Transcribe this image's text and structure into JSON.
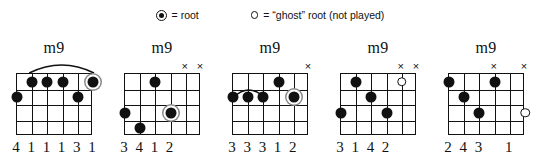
{
  "legend": {
    "root_symbol_name": "filled-circle-with-ring",
    "root_text": "= root",
    "ghost_symbol_name": "hollow-circle",
    "ghost_text": "= “ghost” root (not played)"
  },
  "colors": {
    "ink": "#111111",
    "paper": "#ffffff",
    "root_ring": "#8a8a8a"
  },
  "grid": {
    "strings": 6,
    "frets": 4
  },
  "chords": [
    {
      "name": "m9",
      "barre": {
        "from_string": 5,
        "to_string": 1,
        "above_nut": true
      },
      "mutes": [],
      "dots": [
        {
          "string": 5,
          "fret": 1,
          "type": "normal"
        },
        {
          "string": 4,
          "fret": 1,
          "type": "normal"
        },
        {
          "string": 3,
          "fret": 1,
          "type": "normal"
        },
        {
          "string": 1,
          "fret": 1,
          "type": "root"
        },
        {
          "string": 6,
          "fret": 2,
          "type": "normal"
        },
        {
          "string": 2,
          "fret": 2,
          "type": "normal"
        }
      ],
      "fingering": [
        {
          "string": 6,
          "label": "4"
        },
        {
          "string": 5,
          "label": "1"
        },
        {
          "string": 4,
          "label": "1"
        },
        {
          "string": 3,
          "label": "1"
        },
        {
          "string": 2,
          "label": "3"
        },
        {
          "string": 1,
          "label": "1"
        }
      ]
    },
    {
      "name": "m9",
      "barre": null,
      "mutes": [
        2,
        1
      ],
      "dots": [
        {
          "string": 4,
          "fret": 1,
          "type": "normal"
        },
        {
          "string": 6,
          "fret": 3,
          "type": "normal"
        },
        {
          "string": 3,
          "fret": 3,
          "type": "root"
        },
        {
          "string": 5,
          "fret": 4,
          "type": "normal"
        }
      ],
      "fingering": [
        {
          "string": 6,
          "label": "3"
        },
        {
          "string": 5,
          "label": "4"
        },
        {
          "string": 4,
          "label": "1"
        },
        {
          "string": 3,
          "label": "2"
        }
      ]
    },
    {
      "name": "m9",
      "barre": {
        "from_string": 6,
        "to_string": 4,
        "above_nut": false,
        "fret": 2
      },
      "mutes": [
        1
      ],
      "dots": [
        {
          "string": 3,
          "fret": 1,
          "type": "normal"
        },
        {
          "string": 6,
          "fret": 2,
          "type": "normal"
        },
        {
          "string": 5,
          "fret": 2,
          "type": "normal"
        },
        {
          "string": 4,
          "fret": 2,
          "type": "normal"
        },
        {
          "string": 2,
          "fret": 2,
          "type": "root"
        }
      ],
      "fingering": [
        {
          "string": 6,
          "label": "3"
        },
        {
          "string": 5,
          "label": "3"
        },
        {
          "string": 4,
          "label": "3"
        },
        {
          "string": 3,
          "label": "1"
        },
        {
          "string": 2,
          "label": "2"
        }
      ]
    },
    {
      "name": "m9",
      "barre": null,
      "mutes": [
        2,
        1
      ],
      "dots": [
        {
          "string": 2,
          "fret": 1,
          "type": "ghost"
        },
        {
          "string": 5,
          "fret": 1,
          "type": "normal"
        },
        {
          "string": 4,
          "fret": 2,
          "type": "normal"
        },
        {
          "string": 6,
          "fret": 3,
          "type": "normal"
        },
        {
          "string": 3,
          "fret": 3,
          "type": "normal"
        }
      ],
      "fingering": [
        {
          "string": 6,
          "label": "3"
        },
        {
          "string": 5,
          "label": "1"
        },
        {
          "string": 4,
          "label": "4"
        },
        {
          "string": 3,
          "label": "2"
        }
      ]
    },
    {
      "name": "m9",
      "barre": null,
      "mutes": [
        3,
        1
      ],
      "dots": [
        {
          "string": 6,
          "fret": 1,
          "type": "normal"
        },
        {
          "string": 3,
          "fret": 1,
          "type": "normal"
        },
        {
          "string": 5,
          "fret": 2,
          "type": "normal"
        },
        {
          "string": 4,
          "fret": 3,
          "type": "normal"
        },
        {
          "string": 1,
          "fret": 3,
          "type": "ghost"
        }
      ],
      "fingering": [
        {
          "string": 6,
          "label": "2"
        },
        {
          "string": 5,
          "label": "4"
        },
        {
          "string": 4,
          "label": "3"
        },
        {
          "string": 2,
          "label": "1"
        }
      ]
    }
  ]
}
